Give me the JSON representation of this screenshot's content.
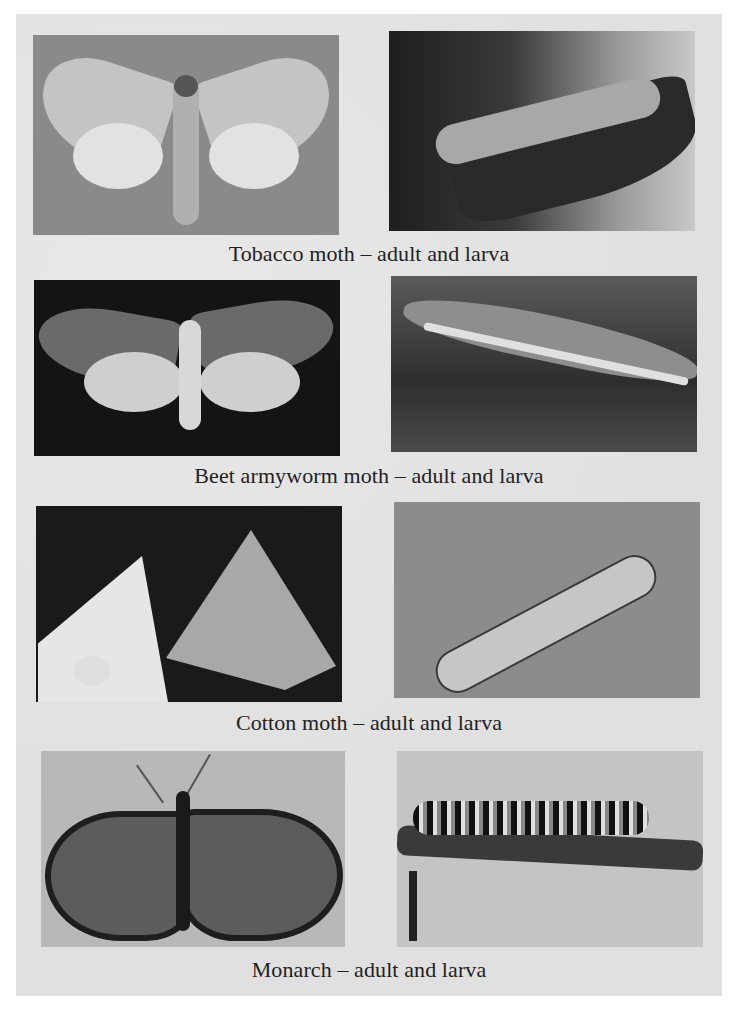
{
  "figure": {
    "rows": [
      {
        "caption": "Tobacco moth – adult and larva",
        "adult_image": {
          "subject": "tobacco-moth-adult",
          "tone": "light moth on gray background"
        },
        "larva_image": {
          "subject": "tobacco-moth-larva",
          "tone": "pale larva on dark leaf"
        }
      },
      {
        "caption": "Beet armyworm moth – adult and larva",
        "adult_image": {
          "subject": "beet-armyworm-moth-adult",
          "tone": "mottled moth on black background"
        },
        "larva_image": {
          "subject": "beet-armyworm-larva",
          "tone": "striped larva on dark stem"
        }
      },
      {
        "caption": "Cotton moth – adult and larva",
        "adult_image": {
          "subject": "cotton-moth-adult",
          "tone": "two pale moths on dark background"
        },
        "larva_image": {
          "subject": "cotton-moth-larva",
          "tone": "spotted larva on gray background"
        }
      },
      {
        "caption": "Monarch – adult and larva",
        "adult_image": {
          "subject": "monarch-butterfly-adult",
          "tone": "veined butterfly on light background"
        },
        "larva_image": {
          "subject": "monarch-caterpillar",
          "tone": "banded caterpillar on twig"
        }
      }
    ]
  }
}
